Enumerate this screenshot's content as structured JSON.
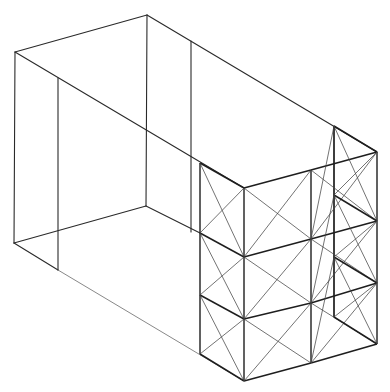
{
  "diagram": {
    "title": "",
    "colors": {
      "line": "#2a2a2a",
      "brace": "#444444",
      "background": "#ffffff"
    },
    "box_frame": {
      "lines": [
        [
          15,
          52,
          147,
          15
        ],
        [
          147,
          15,
          377,
          152
        ],
        [
          15,
          52,
          244,
          188
        ],
        [
          15,
          52,
          14,
          243
        ],
        [
          147,
          15,
          146,
          206
        ],
        [
          58,
          78,
          58,
          270
        ],
        [
          191,
          41,
          191,
          232
        ],
        [
          14,
          243,
          146,
          206
        ],
        [
          146,
          206,
          200,
          233
        ],
        [
          14,
          243,
          58,
          270
        ],
        [
          58,
          270,
          244,
          381,
          "thin"
        ],
        [
          334,
          126,
          334,
          317
        ]
      ]
    },
    "scaffold": {
      "columns": [
        {
          "name": "left-front",
          "x": 200,
          "nodes_y": [
            163,
            233,
            295,
            354
          ]
        },
        {
          "name": "front-corner",
          "x": 244,
          "nodes_y": [
            188,
            257,
            319,
            381
          ]
        },
        {
          "name": "middle",
          "x": 311,
          "nodes_y": [
            170,
            239,
            303,
            363
          ]
        },
        {
          "name": "right",
          "x": 377,
          "nodes_y": [
            152,
            221,
            283,
            344
          ]
        },
        {
          "name": "back-right",
          "x": 334,
          "nodes_y": [
            126,
            195,
            257,
            317
          ]
        }
      ],
      "levels": 3
    }
  }
}
